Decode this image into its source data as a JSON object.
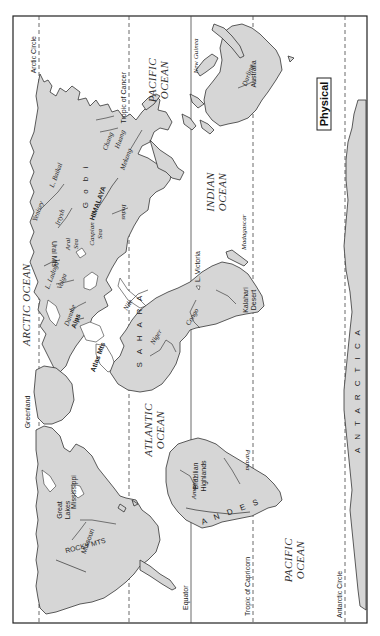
{
  "map": {
    "title": "Physical",
    "orientation": "rotated 90 degrees clockwise",
    "reference_lines": {
      "arctic_circle": "Arctic Circle",
      "tropic_of_cancer": "Tropic of Cancer",
      "equator": "Equator",
      "tropic_of_capricorn": "Tropic of Capricorn",
      "antarctic_circle": "Antarctic Circle"
    },
    "oceans": {
      "arctic": "ARCTIC OCEAN",
      "pacific_north_1": "PACIFIC",
      "pacific_north_2": "OCEAN",
      "indian_1": "INDIAN",
      "indian_2": "OCEAN",
      "atlantic_1": "ATLANTIC",
      "atlantic_2": "OCEAN",
      "pacific_south_1": "PACIFIC",
      "pacific_south_2": "OCEAN"
    },
    "continents": {
      "antarctica": "A N T A R C T I C A",
      "australia": "Australia"
    },
    "features": {
      "greenland": "Greenland",
      "great_lakes_1": "Great",
      "great_lakes_2": "Lakes",
      "mississippi": "Mississippi",
      "missouri": "Missouri",
      "rocky_mts": "ROCKY MTS",
      "amazon": "Amazon",
      "brazilian_highlands_1": "Brazilian",
      "brazilian_highlands_2": "Highlands",
      "parana": "Parana",
      "andes": "A N D E S",
      "alps": "Alps",
      "danube": "Danube",
      "atlas_mts": "Atlas Mts",
      "sahara": "S A H A R A",
      "niger": "Niger",
      "nile": "Nile",
      "congo": "Congo",
      "kalahari_1": "Kalahari",
      "kalahari_2": "Desert",
      "l_victoria": "L. Victoria",
      "madagascar": "Madagascar",
      "l_ladoga": "L. Ladoga",
      "volga": "Volga",
      "ural_mts": "Ural Mts",
      "aral_sea_1": "Aral",
      "aral_sea_2": "Sea",
      "caspian_sea_1": "Caspian",
      "caspian_sea_2": "Sea",
      "yenisey": "Yenisey",
      "irtysh": "Irtysh",
      "l_baikal": "L. Baikal",
      "gobi": "G o b i",
      "himalaya": "HIMALAYA",
      "indus": "Indus",
      "mekong": "Mekong",
      "chang": "Chang",
      "huang": "Huang",
      "new_guinea": "New Guinea",
      "darling": "Darling"
    }
  }
}
